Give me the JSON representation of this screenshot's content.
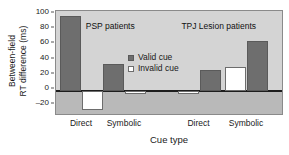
{
  "chart_data": {
    "type": "bar",
    "title": "",
    "xlabel": "Cue type",
    "ylabel": "Between-field RT difference (ms)",
    "ylabel_line1": "Between-field",
    "ylabel_line2": "RT difference (ms)",
    "ylim": [
      -30,
      105
    ],
    "yticks": [
      100,
      80,
      60,
      40,
      20,
      0,
      -20
    ],
    "ytick_labels": [
      "100",
      "80",
      "60",
      "40",
      "20",
      "0",
      "–20"
    ],
    "grid": false,
    "legend_position": "center",
    "categories": [
      "Direct",
      "Symbolic",
      "Direct",
      "Symbolic"
    ],
    "groups": [
      {
        "name": "PSP patients",
        "categories": [
          "Direct",
          "Symbolic"
        ]
      },
      {
        "name": "TPJ Lesion patients",
        "categories": [
          "Direct",
          "Symbolic"
        ]
      }
    ],
    "series": [
      {
        "name": "Valid cue",
        "color": "#6e6e6e",
        "values": [
          98,
          36,
          28,
          66
        ]
      },
      {
        "name": "Invalid cue",
        "color": "#ffffff",
        "values": [
          -25,
          -4,
          -4,
          32
        ]
      }
    ],
    "bars": [
      {
        "group": "PSP patients",
        "category": "Direct",
        "series": "Valid cue",
        "value": 98,
        "order": 0
      },
      {
        "group": "PSP patients",
        "category": "Direct",
        "series": "Invalid cue",
        "value": -25,
        "order": 1
      },
      {
        "group": "PSP patients",
        "category": "Symbolic",
        "series": "Valid cue",
        "value": 36,
        "order": 0
      },
      {
        "group": "PSP patients",
        "category": "Symbolic",
        "series": "Invalid cue",
        "value": -4,
        "order": 1
      },
      {
        "group": "TPJ Lesion patients",
        "category": "Direct",
        "series": "Invalid cue",
        "value": -4,
        "order": 0
      },
      {
        "group": "TPJ Lesion patients",
        "category": "Direct",
        "series": "Valid cue",
        "value": 28,
        "order": 1
      },
      {
        "group": "TPJ Lesion patients",
        "category": "Symbolic",
        "series": "Invalid cue",
        "value": 32,
        "order": 0
      },
      {
        "group": "TPJ Lesion patients",
        "category": "Symbolic",
        "series": "Valid cue",
        "value": 66,
        "order": 1
      }
    ],
    "annotations": [
      {
        "text": "PSP patients",
        "x_pct": 24,
        "y_value": 92
      },
      {
        "text": "TPJ Lesion patients",
        "x_pct": 72,
        "y_value": 92
      }
    ],
    "legend": [
      {
        "label": "Valid cue",
        "swatch": "filled-dark"
      },
      {
        "label": "Invalid cue",
        "swatch": "open-white"
      }
    ],
    "colors": {
      "valid_cue": "#6e6e6e",
      "invalid_cue": "#ffffff",
      "plot_background_positive": "#d4d4d4",
      "plot_background_negative": "#b9b9b9",
      "zero_line": "#1d1d1d",
      "plot_border": "#8a8a8a"
    }
  }
}
